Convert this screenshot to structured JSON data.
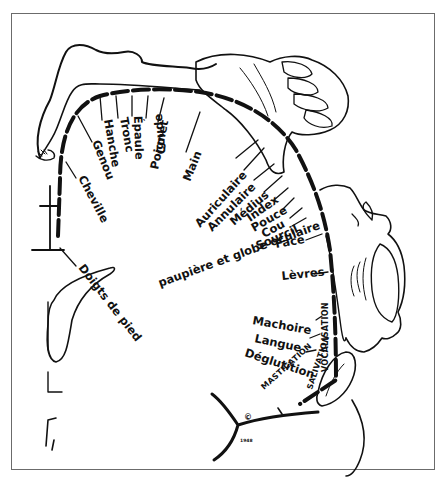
{
  "diagram": {
    "colors": {
      "ink": "#111111",
      "background": "#ffffff",
      "frame": "#6b6b6b"
    },
    "body_part_labels": [
      {
        "id": "doigts-de-pied",
        "text": "Doigts de pied"
      },
      {
        "id": "cheville",
        "text": "Cheville"
      },
      {
        "id": "genou",
        "text": "Genou"
      },
      {
        "id": "hanche",
        "text": "Hanche"
      },
      {
        "id": "tronc",
        "text": "Tronc"
      },
      {
        "id": "epaule",
        "text": "Épaule"
      },
      {
        "id": "coude",
        "text": "Coude"
      },
      {
        "id": "poignet",
        "text": "Poignet"
      },
      {
        "id": "main",
        "text": "Main"
      },
      {
        "id": "auriculaire",
        "text": "Auriculaire"
      },
      {
        "id": "annulaire",
        "text": "Annulaire"
      },
      {
        "id": "medius",
        "text": "Médius"
      },
      {
        "id": "index",
        "text": "Index"
      },
      {
        "id": "pouce",
        "text": "Pouce"
      },
      {
        "id": "cou",
        "text": "Cou"
      },
      {
        "id": "sourcil",
        "text": "Sourcil"
      },
      {
        "id": "paupiere",
        "text": "paupière et globe oculaire"
      },
      {
        "id": "face",
        "text": "Face"
      },
      {
        "id": "levres",
        "text": "Lèvres"
      },
      {
        "id": "machoire",
        "text": "Machoire"
      },
      {
        "id": "langue",
        "text": "Langue"
      },
      {
        "id": "deglutition",
        "text": "Déglutition"
      }
    ],
    "function_labels": {
      "vocalisation": "VOCALISATION",
      "salivation": "SALIVATION",
      "mastication": "MASTICATION"
    },
    "copyright": {
      "symbol": "©",
      "year": "1948"
    }
  }
}
